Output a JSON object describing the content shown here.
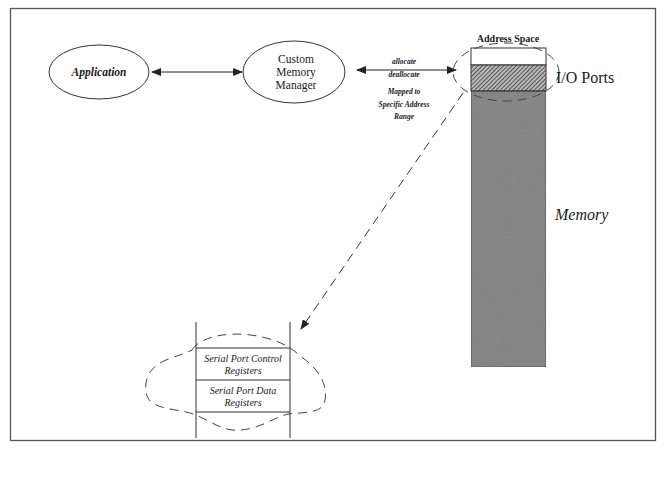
{
  "diagram": {
    "nodes": {
      "application": {
        "label": "Application"
      },
      "memory_manager": {
        "lines": [
          "Custom",
          "Memory",
          "Manager"
        ]
      },
      "address_space": {
        "title": "Address Space",
        "regions": {
          "io_ports": {
            "label": "I/O Ports"
          },
          "memory": {
            "label": "Memory"
          }
        }
      },
      "serial_registers": {
        "rows": [
          {
            "lines": [
              "Serial Port Control",
              "Registers"
            ]
          },
          {
            "lines": [
              "Serial Port Data",
              "Registers"
            ]
          }
        ]
      }
    },
    "edges": {
      "app_to_manager": {
        "type": "bidirectional"
      },
      "manager_to_address": {
        "type": "bidirectional",
        "label_top": "allocate",
        "label_bottom": "deallocate",
        "note_lines": [
          "Mapped to",
          "Specific Address",
          "Range"
        ]
      },
      "io_to_serial": {
        "type": "dashed-directed"
      }
    },
    "colors": {
      "stroke": "#2a2a2a",
      "memory_fill": "#8a8a8a",
      "hatch": "#3a3a3a",
      "frame": "#555555"
    }
  }
}
